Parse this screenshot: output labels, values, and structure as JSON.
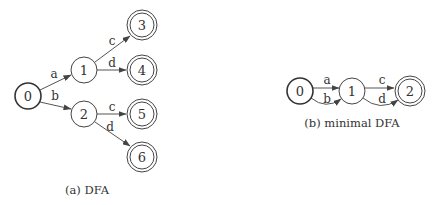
{
  "figure_a": {
    "caption": "(a) DFA",
    "nodes": [
      {
        "id": "0",
        "label": "0",
        "start": true,
        "accepting": false
      },
      {
        "id": "1",
        "label": "1",
        "start": false,
        "accepting": false
      },
      {
        "id": "2",
        "label": "2",
        "start": false,
        "accepting": false
      },
      {
        "id": "3",
        "label": "3",
        "start": false,
        "accepting": true
      },
      {
        "id": "4",
        "label": "4",
        "start": false,
        "accepting": true
      },
      {
        "id": "5",
        "label": "5",
        "start": false,
        "accepting": true
      },
      {
        "id": "6",
        "label": "6",
        "start": false,
        "accepting": true
      }
    ],
    "edges": [
      {
        "from": "0",
        "to": "1",
        "label": "a"
      },
      {
        "from": "0",
        "to": "2",
        "label": "b"
      },
      {
        "from": "1",
        "to": "3",
        "label": "c"
      },
      {
        "from": "1",
        "to": "4",
        "label": "d"
      },
      {
        "from": "2",
        "to": "5",
        "label": "c"
      },
      {
        "from": "2",
        "to": "6",
        "label": "d"
      }
    ]
  },
  "figure_b": {
    "caption": "(b) minimal DFA",
    "nodes": [
      {
        "id": "0",
        "label": "0",
        "start": true,
        "accepting": false
      },
      {
        "id": "1",
        "label": "1",
        "start": false,
        "accepting": false
      },
      {
        "id": "2",
        "label": "2",
        "start": false,
        "accepting": true
      }
    ],
    "edges": [
      {
        "from": "0",
        "to": "1",
        "label": "a"
      },
      {
        "from": "0",
        "to": "1",
        "label": "b"
      },
      {
        "from": "1",
        "to": "2",
        "label": "c"
      },
      {
        "from": "1",
        "to": "2",
        "label": "d"
      }
    ]
  }
}
